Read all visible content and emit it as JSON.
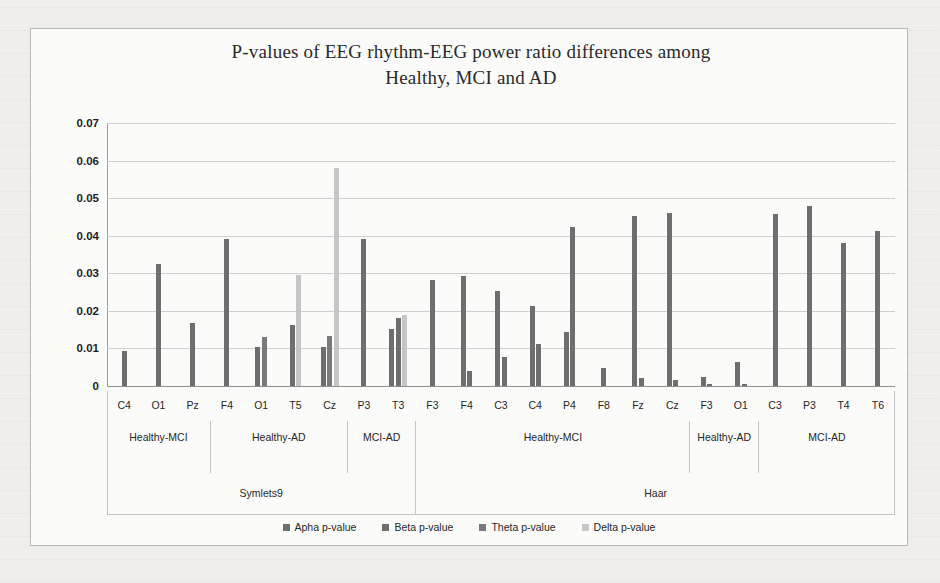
{
  "chart_data": {
    "type": "bar",
    "title": "P-values of EEG rhythm-EEG power ratio differences among Healthy, MCI and AD",
    "title_line1": "P-values of EEG rhythm-EEG power ratio differences among",
    "title_line2": "Healthy, MCI and AD",
    "xlabel": "",
    "ylabel": "",
    "ylim": [
      0,
      0.07
    ],
    "ytick_labels": [
      "0.07",
      "0.06",
      "0.05",
      "0.04",
      "0.03",
      "0.02",
      "0.01",
      "0"
    ],
    "ytick_values": [
      0.07,
      0.06,
      0.05,
      0.04,
      0.03,
      0.02,
      0.01,
      0
    ],
    "grid": true,
    "legend_position": "bottom",
    "series": [
      {
        "name": "Apha p-value",
        "color": "#6e6e6e"
      },
      {
        "name": "Beta p-value",
        "color": "#6e6e6e"
      },
      {
        "name": "Theta p-value",
        "color": "#7a7a7a"
      },
      {
        "name": "Delta p-value",
        "color": "#c6c6c6"
      }
    ],
    "categories": [
      "C4",
      "O1",
      "Pz",
      "F4",
      "O1",
      "T5",
      "Cz",
      "P3",
      "T3",
      "F3",
      "F4",
      "C3",
      "C4",
      "P4",
      "F8",
      "Fz",
      "Cz",
      "F3",
      "O1",
      "C3",
      "P3",
      "T4",
      "T6"
    ],
    "bars": [
      {
        "category": "C4",
        "series": "Apha p-value",
        "value": 0.0092,
        "color": "#6e6e6e"
      },
      {
        "category": "O1",
        "series": "Apha p-value",
        "value": 0.0325,
        "color": "#6e6e6e"
      },
      {
        "category": "Pz",
        "series": "Apha p-value",
        "value": 0.0167,
        "color": "#6e6e6e"
      },
      {
        "category": "F4",
        "series": "Apha p-value",
        "value": 0.0392,
        "color": "#6e6e6e"
      },
      {
        "category": "O1",
        "series": "Beta p-value",
        "value": 0.0103,
        "color": "#6e6e6e"
      },
      {
        "category": "O1",
        "series": "Theta p-value",
        "value": 0.0131,
        "color": "#7a7a7a"
      },
      {
        "category": "T5",
        "series": "Apha p-value",
        "value": 0.0162,
        "color": "#6e6e6e"
      },
      {
        "category": "T5",
        "series": "Delta p-value",
        "value": 0.0295,
        "color": "#c6c6c6"
      },
      {
        "category": "Cz",
        "series": "Apha p-value",
        "value": 0.0104,
        "color": "#6e6e6e"
      },
      {
        "category": "Cz",
        "series": "Theta p-value",
        "value": 0.0134,
        "color": "#7a7a7a"
      },
      {
        "category": "Cz",
        "series": "Delta p-value",
        "value": 0.058,
        "color": "#c6c6c6"
      },
      {
        "category": "P3",
        "series": "Apha p-value",
        "value": 0.039,
        "color": "#6e6e6e"
      },
      {
        "category": "T3",
        "series": "Apha p-value",
        "value": 0.0152,
        "color": "#6e6e6e"
      },
      {
        "category": "T3",
        "series": "Beta p-value",
        "value": 0.0181,
        "color": "#6e6e6e"
      },
      {
        "category": "T3",
        "series": "Delta p-value",
        "value": 0.019,
        "color": "#c6c6c6"
      },
      {
        "category": "F3",
        "series": "Apha p-value",
        "value": 0.0283,
        "color": "#6e6e6e"
      },
      {
        "category": "F4",
        "series": "Apha p-value",
        "value": 0.0292,
        "color": "#6e6e6e"
      },
      {
        "category": "F4",
        "series": "Beta p-value",
        "value": 0.0041,
        "color": "#6e6e6e"
      },
      {
        "category": "C3",
        "series": "Apha p-value",
        "value": 0.0254,
        "color": "#6e6e6e"
      },
      {
        "category": "C3",
        "series": "Beta p-value",
        "value": 0.0076,
        "color": "#6e6e6e"
      },
      {
        "category": "C4",
        "series": "Apha p-value",
        "value": 0.0212,
        "color": "#6e6e6e"
      },
      {
        "category": "C4",
        "series": "Beta p-value",
        "value": 0.0113,
        "color": "#6e6e6e"
      },
      {
        "category": "P4",
        "series": "Apha p-value",
        "value": 0.0143,
        "color": "#6e6e6e"
      },
      {
        "category": "P4",
        "series": "Beta p-value",
        "value": 0.0422,
        "color": "#6e6e6e"
      },
      {
        "category": "F8",
        "series": "Apha p-value",
        "value": 0.0049,
        "color": "#6e6e6e"
      },
      {
        "category": "Fz",
        "series": "Apha p-value",
        "value": 0.0452,
        "color": "#6e6e6e"
      },
      {
        "category": "Fz",
        "series": "Beta p-value",
        "value": 0.0021,
        "color": "#6e6e6e"
      },
      {
        "category": "Cz",
        "series": "Apha p-value",
        "value": 0.0461,
        "color": "#6e6e6e"
      },
      {
        "category": "Cz",
        "series": "Beta p-value",
        "value": 0.0015,
        "color": "#6e6e6e"
      },
      {
        "category": "F3",
        "series": "Apha p-value",
        "value": 0.0024,
        "color": "#6e6e6e"
      },
      {
        "category": "F3",
        "series": "Beta p-value",
        "value": 0.0005,
        "color": "#6e6e6e"
      },
      {
        "category": "O1",
        "series": "Apha p-value",
        "value": 0.0064,
        "color": "#6e6e6e"
      },
      {
        "category": "O1",
        "series": "Beta p-value",
        "value": 0.0006,
        "color": "#6e6e6e"
      },
      {
        "category": "C3",
        "series": "Apha p-value",
        "value": 0.0459,
        "color": "#6e6e6e"
      },
      {
        "category": "P3",
        "series": "Apha p-value",
        "value": 0.0478,
        "color": "#6e6e6e"
      },
      {
        "category": "T4",
        "series": "Apha p-value",
        "value": 0.038,
        "color": "#6e6e6e"
      },
      {
        "category": "T6",
        "series": "Apha p-value",
        "value": 0.0412,
        "color": "#6e6e6e"
      }
    ],
    "groups_level1": [
      {
        "label": "Healthy-MCI",
        "start": 0,
        "end": 3
      },
      {
        "label": "Healthy-AD",
        "start": 3,
        "end": 7
      },
      {
        "label": "MCI-AD",
        "start": 7,
        "end": 9
      },
      {
        "label": "Healthy-MCI",
        "start": 9,
        "end": 17
      },
      {
        "label": "Healthy-\nAD",
        "start": 17,
        "end": 19
      },
      {
        "label": "MCI-AD",
        "start": 19,
        "end": 23
      }
    ],
    "groups_level2": [
      {
        "label": "Symlets9",
        "start": 0,
        "end": 9
      },
      {
        "label": "Haar",
        "start": 9,
        "end": 23
      }
    ]
  }
}
